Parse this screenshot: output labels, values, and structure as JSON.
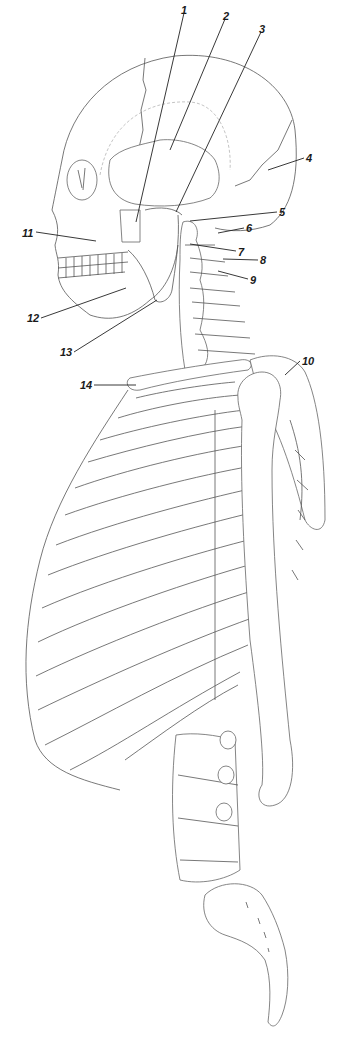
{
  "figure": {
    "style": "black line drawing on white",
    "labels": [
      {
        "id": "1",
        "text": "1",
        "x": 125,
        "y": 5,
        "target": [
          127,
          238
        ]
      },
      {
        "id": "2",
        "text": "2",
        "x": 223,
        "y": 11,
        "target": [
          170,
          150
        ]
      },
      {
        "id": "3",
        "text": "3",
        "x": 259,
        "y": 24,
        "target": [
          176,
          212
        ]
      },
      {
        "id": "4",
        "text": "4",
        "x": 306,
        "y": 153,
        "target": [
          268,
          170
        ]
      },
      {
        "id": "5",
        "text": "5",
        "x": 279,
        "y": 207,
        "target": [
          190,
          221
        ]
      },
      {
        "id": "6",
        "text": "6",
        "x": 246,
        "y": 223,
        "target": [
          218,
          233
        ]
      },
      {
        "id": "7",
        "text": "7",
        "x": 238,
        "y": 247,
        "target": [
          190,
          244
        ]
      },
      {
        "id": "8",
        "text": "8",
        "x": 260,
        "y": 255,
        "target": [
          223,
          259
        ]
      },
      {
        "id": "9",
        "text": "9",
        "x": 250,
        "y": 275,
        "target": [
          218,
          271
        ]
      },
      {
        "id": "10",
        "text": "10",
        "x": 302,
        "y": 356,
        "target": [
          285,
          375
        ]
      },
      {
        "id": "11",
        "text": "11",
        "x": 22,
        "y": 228,
        "target": [
          96,
          241
        ]
      },
      {
        "id": "12",
        "text": "12",
        "x": 27,
        "y": 313,
        "target": [
          126,
          288
        ]
      },
      {
        "id": "13",
        "text": "13",
        "x": 60,
        "y": 347,
        "target": [
          157,
          300
        ]
      },
      {
        "id": "14",
        "text": "14",
        "x": 80,
        "y": 380,
        "target": [
          136,
          385
        ]
      }
    ]
  }
}
